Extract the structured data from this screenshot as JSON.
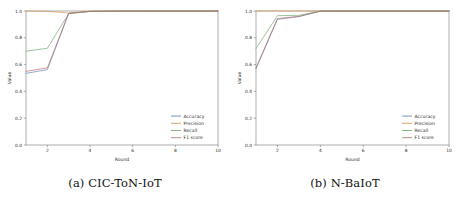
{
  "figure": {
    "panels": [
      {
        "caption": "(a) CIC-ToN-IoT",
        "caption_prefix": "(a)",
        "caption_name": "CIC-ToN-IoT"
      },
      {
        "caption": "(b) N-BaIoT",
        "caption_prefix": "(b)",
        "caption_name": "N-BaIoT"
      }
    ]
  },
  "chart_data": [
    {
      "type": "line",
      "title": "(a) CIC-ToN-IoT",
      "xlabel": "Round",
      "ylabel": "Value",
      "x": [
        1,
        2,
        3,
        4,
        5,
        6,
        7,
        8,
        9,
        10
      ],
      "xlim": [
        1,
        10
      ],
      "ylim": [
        0.0,
        1.0
      ],
      "xticks": [
        2,
        4,
        6,
        8,
        10
      ],
      "xticklabels": [
        "2",
        "4",
        "6",
        "8",
        "10"
      ],
      "yticks": [
        0.0,
        0.2,
        0.4,
        0.6,
        0.8,
        1.0
      ],
      "yticklabels": [
        "0.0",
        "0.2",
        "0.4",
        "0.6",
        "0.8",
        "1.0"
      ],
      "grid": false,
      "legend_position": "lower right",
      "series": [
        {
          "name": "Accuracy",
          "color": "#5b7fb4",
          "values": [
            0.535,
            0.562,
            0.982,
            0.997,
            0.999,
            0.999,
            1.0,
            1.0,
            1.0,
            1.0
          ]
        },
        {
          "name": "Precision",
          "color": "#d98f4a",
          "values": [
            1.0,
            0.998,
            0.985,
            0.998,
            0.999,
            1.0,
            1.0,
            1.0,
            1.0,
            1.0
          ]
        },
        {
          "name": "Recall",
          "color": "#6aa56a",
          "values": [
            0.7,
            0.722,
            0.98,
            0.997,
            0.999,
            0.999,
            1.0,
            1.0,
            1.0,
            1.0
          ]
        },
        {
          "name": "F1 score",
          "color": "#b96b6b",
          "values": [
            0.55,
            0.575,
            0.983,
            0.997,
            0.999,
            0.999,
            1.0,
            1.0,
            1.0,
            1.0
          ]
        }
      ]
    },
    {
      "type": "line",
      "title": "(b) N-BaIoT",
      "xlabel": "Round",
      "ylabel": "Value",
      "x": [
        1,
        2,
        3,
        4,
        5,
        6,
        7,
        8,
        9,
        10
      ],
      "xlim": [
        1,
        10
      ],
      "ylim": [
        0.0,
        1.0
      ],
      "xticks": [
        2,
        4,
        6,
        8,
        10
      ],
      "xticklabels": [
        "2",
        "4",
        "6",
        "8",
        "10"
      ],
      "yticks": [
        0.0,
        0.2,
        0.4,
        0.6,
        0.8,
        1.0
      ],
      "yticklabels": [
        "0.0",
        "0.2",
        "0.4",
        "0.6",
        "0.8",
        "1.0"
      ],
      "grid": false,
      "legend_position": "lower right",
      "series": [
        {
          "name": "Accuracy",
          "color": "#5b7fb4",
          "values": [
            0.57,
            0.938,
            0.958,
            0.999,
            1.0,
            1.0,
            1.0,
            1.0,
            1.0,
            1.0
          ]
        },
        {
          "name": "Precision",
          "color": "#d98f4a",
          "values": [
            1.0,
            1.0,
            1.0,
            1.0,
            1.0,
            1.0,
            1.0,
            1.0,
            1.0,
            1.0
          ]
        },
        {
          "name": "Recall",
          "color": "#6aa56a",
          "values": [
            0.72,
            0.965,
            0.968,
            0.999,
            1.0,
            1.0,
            1.0,
            1.0,
            1.0,
            1.0
          ]
        },
        {
          "name": "F1 score",
          "color": "#b96b6b",
          "values": [
            0.575,
            0.944,
            0.96,
            0.999,
            1.0,
            1.0,
            1.0,
            1.0,
            1.0,
            1.0
          ]
        }
      ]
    }
  ]
}
